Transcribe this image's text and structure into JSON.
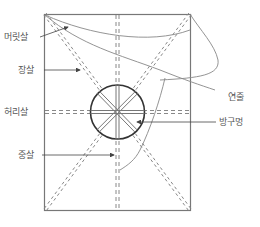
{
  "diagram": {
    "labels": {
      "head_stick": "머릿살",
      "long_stick": "장살",
      "waist_stick": "허리살",
      "center_stick": "중살",
      "kite_string": "연줄",
      "center_hole": "방구멍"
    },
    "colors": {
      "frame": "#777777",
      "stick": "#777777",
      "circle": "#333333",
      "string": "#888888",
      "text": "#555555"
    }
  }
}
